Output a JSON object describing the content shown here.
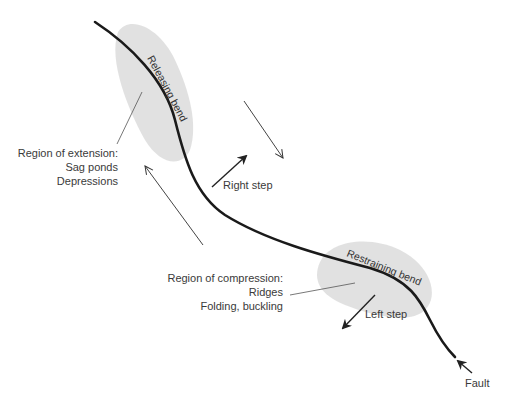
{
  "diagram": {
    "type": "strike-slip fault bends and steps",
    "labels": {
      "releasing_bend": "Releasing bend",
      "restraining_bend": "Restraining bend",
      "extension_title": "Region of extension:",
      "extension_item1": "Sag ponds",
      "extension_item2": "Depressions",
      "compression_title": "Region of compression:",
      "compression_item1": "Ridges",
      "compression_item2": "Folding, buckling",
      "right_step": "Right step",
      "left_step": "Left step",
      "fault": "Fault"
    },
    "colors": {
      "fault_line": "#1a1a1a",
      "shaded_region": "#dcdcdc",
      "arrow": "#333333",
      "text": "#3a3a3a"
    }
  }
}
